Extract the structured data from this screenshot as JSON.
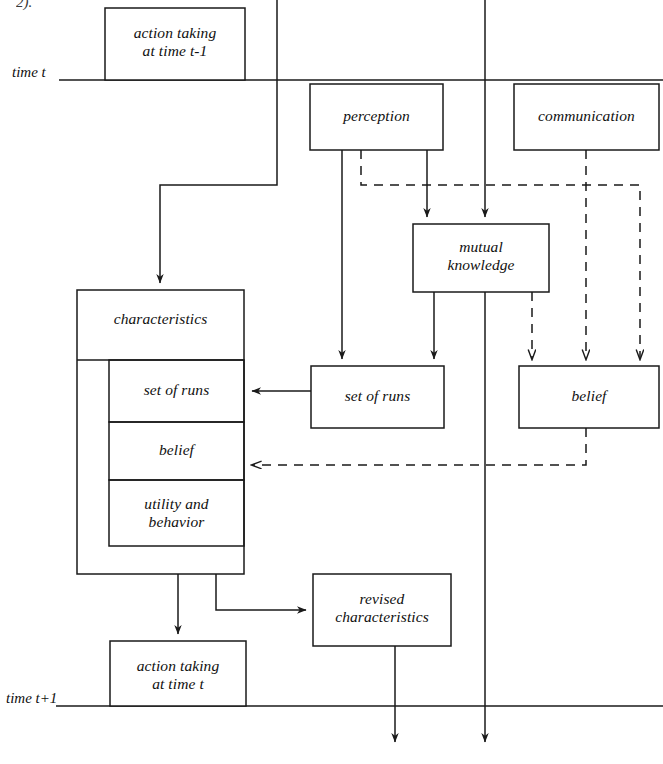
{
  "figure": {
    "caption_fragment": "2).",
    "timeline": {
      "top_label": "time t",
      "bottom_label": "time t+1"
    }
  },
  "nodes": {
    "action_prev": {
      "label": "action taking\nat time t-1"
    },
    "perception": {
      "label": "perception"
    },
    "communication": {
      "label": "communication"
    },
    "mutual_knowledge": {
      "label": "mutual\nknowledge"
    },
    "set_of_runs_outer": {
      "label": "set of runs"
    },
    "belief_outer": {
      "label": "belief"
    },
    "characteristics": {
      "label": "characteristics"
    },
    "char_set_of_runs": {
      "label": "set of runs"
    },
    "char_belief": {
      "label": "belief"
    },
    "char_utility": {
      "label": "utility and\nbehavior"
    },
    "revised_characteristics": {
      "label": "revised\ncharacteristics"
    },
    "action_current": {
      "label": "action taking\nat time t"
    }
  },
  "style": {
    "stroke": "#1a1a1a",
    "background": "#ffffff",
    "dash_pattern": "9,7"
  }
}
